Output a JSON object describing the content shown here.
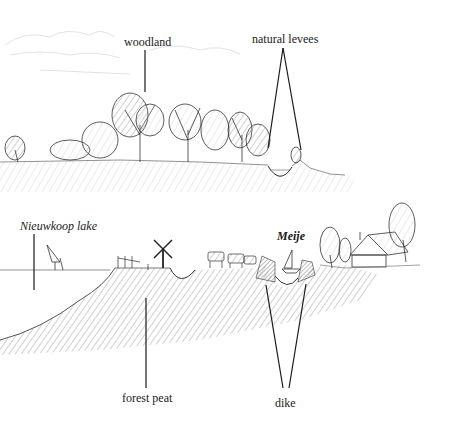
{
  "figure": {
    "upper_panel": {
      "description": "Natural landscape before reclamation",
      "labels": {
        "woodland": "woodland",
        "natural_levees": "natural levees"
      }
    },
    "lower_panel": {
      "description": "Reclaimed peat landscape with lake, polder and dike",
      "labels": {
        "lake": "Nieuwkoop lake",
        "river": "Meije",
        "forest_peat": "forest peat",
        "dike": "dike"
      }
    },
    "colors": {
      "ink": "#1a1a1a",
      "hatch": "#8a8a8a",
      "light_hatch": "#c4c4c4",
      "background": "#ffffff"
    }
  }
}
